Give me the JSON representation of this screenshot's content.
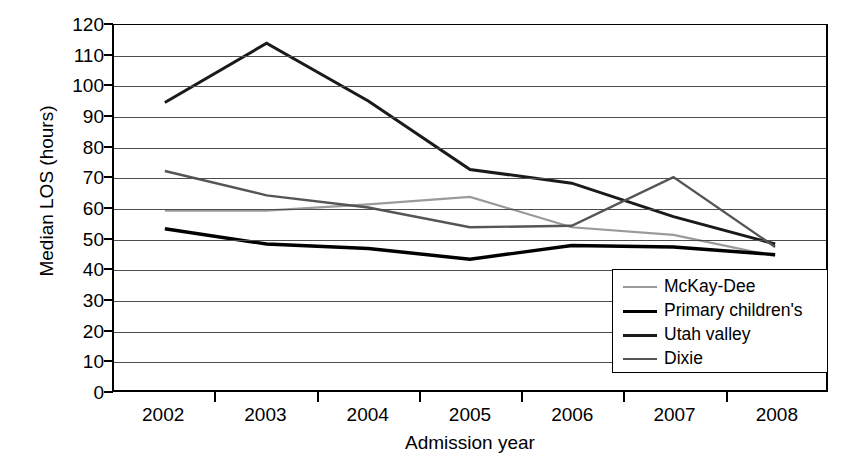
{
  "chart_data": {
    "type": "line",
    "title": "",
    "xlabel": "Admission year",
    "ylabel": "Median LOS (hours)",
    "categories": [
      "2002",
      "2003",
      "2004",
      "2005",
      "2006",
      "2007",
      "2008"
    ],
    "ylim": [
      0,
      120
    ],
    "ytick_step": 10,
    "yticks": [
      "120",
      "110",
      "100",
      "90",
      "80",
      "70",
      "60",
      "50",
      "40",
      "30",
      "20",
      "10",
      "0"
    ],
    "grid": "horizontal",
    "legend_position": "inside-bottom-right",
    "series": [
      {
        "name": "McKay-Dee",
        "color": "#9a9a9a",
        "width": 2.2,
        "values": [
          59,
          59,
          61,
          63.5,
          53.5,
          51,
          44
        ]
      },
      {
        "name": "Primary children's",
        "color": "#000000",
        "width": 3.4,
        "values": [
          53,
          48,
          46.5,
          43,
          47.5,
          47,
          44.5
        ]
      },
      {
        "name": "Utah valley",
        "color": "#1a1a1a",
        "width": 3.0,
        "values": [
          94.5,
          114,
          95,
          72.5,
          68,
          57,
          48
        ]
      },
      {
        "name": "Dixie",
        "color": "#555555",
        "width": 2.4,
        "values": [
          72,
          64,
          60,
          53.5,
          54,
          70,
          47
        ]
      }
    ]
  },
  "axes": {
    "y_title": "Median LOS (hours)",
    "x_title": "Admission year"
  },
  "legend": {
    "items": [
      {
        "label": "McKay-Dee"
      },
      {
        "label": "Primary children's"
      },
      {
        "label": "Utah valley"
      },
      {
        "label": "Dixie"
      }
    ]
  }
}
